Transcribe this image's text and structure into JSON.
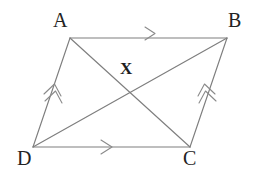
{
  "figure": {
    "name": "parallelogram-with-diagonals",
    "background_color": "#ffffff",
    "line_color": "#7e7e7e",
    "label_color": "#232323",
    "width": 260,
    "height": 172
  },
  "vertices": [
    {
      "id": "A",
      "label": "A",
      "x": 70,
      "y": 38
    },
    {
      "id": "B",
      "label": "B",
      "x": 227,
      "y": 38
    },
    {
      "id": "C",
      "label": "C",
      "x": 190,
      "y": 147
    },
    {
      "id": "D",
      "label": "D",
      "x": 33,
      "y": 147
    }
  ],
  "interior_points": [
    {
      "id": "X",
      "label": "X",
      "x": 130,
      "y": 93
    }
  ],
  "edges": [
    {
      "id": "AB",
      "from": "A",
      "to": "B",
      "ticks": 1,
      "tick_direction": "right"
    },
    {
      "id": "BC",
      "from": "B",
      "to": "C",
      "ticks": 2,
      "tick_direction": "up-right"
    },
    {
      "id": "DC",
      "from": "D",
      "to": "C",
      "ticks": 1,
      "tick_direction": "right"
    },
    {
      "id": "DA",
      "from": "D",
      "to": "A",
      "ticks": 2,
      "tick_direction": "up-right"
    }
  ],
  "diagonals": [
    {
      "id": "AC",
      "from": "A",
      "to": "C"
    },
    {
      "id": "BD",
      "from": "B",
      "to": "D"
    }
  ]
}
